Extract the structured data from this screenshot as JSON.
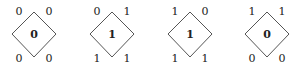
{
  "cells": [
    {
      "top_left": "0",
      "top_right": "0",
      "bottom_left": "0",
      "bottom_right": "0",
      "center": "0"
    },
    {
      "top_left": "0",
      "top_right": "1",
      "bottom_left": "1",
      "bottom_right": "1",
      "center": "1"
    },
    {
      "top_left": "1",
      "top_right": "0",
      "bottom_left": "1",
      "bottom_right": "1",
      "center": "1"
    },
    {
      "top_left": "1",
      "top_right": "1",
      "bottom_left": "0",
      "bottom_right": "0",
      "center": "0"
    }
  ],
  "colors": {
    "stroke": "#555555",
    "text": "#222222"
  }
}
